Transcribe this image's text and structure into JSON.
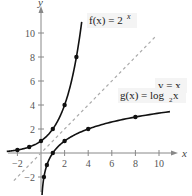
{
  "chart_data": {
    "type": "line",
    "title": "",
    "xlabel": "x",
    "ylabel": "y",
    "xlim": [
      -2.5,
      11.5
    ],
    "ylim": [
      -3.5,
      11.5
    ],
    "grid": false,
    "x_ticks": [
      -2,
      2,
      4,
      6,
      8,
      10
    ],
    "x_tick_labels": [
      "−2",
      "2",
      "4",
      "6",
      "8",
      "10"
    ],
    "y_ticks": [
      -2,
      2,
      4,
      6,
      8,
      10
    ],
    "y_tick_labels": [
      "−2",
      "2",
      "4",
      "6",
      "8",
      "10"
    ],
    "series": [
      {
        "name": "f(x) = 2^x",
        "label": "f(x) = 2",
        "label_sup": "x",
        "style": "solid",
        "color": "#111111",
        "points": [
          [
            -2,
            0.25
          ],
          [
            -1,
            0.5
          ],
          [
            0,
            1
          ],
          [
            1,
            2
          ],
          [
            2,
            4
          ],
          [
            3,
            8
          ]
        ]
      },
      {
        "name": "g(x) = log_2 x",
        "label": "g(x) = log",
        "label_sub": "2",
        "label_tail": " x",
        "style": "solid",
        "color": "#111111",
        "points": [
          [
            0.25,
            -2
          ],
          [
            0.5,
            -1
          ],
          [
            1,
            0
          ],
          [
            2,
            1
          ],
          [
            4,
            2
          ],
          [
            8,
            3
          ]
        ]
      },
      {
        "name": "y = x",
        "label": "y = x",
        "style": "dashed",
        "color": "#aaaaaa",
        "points": [
          [
            -2.5,
            -2.5
          ],
          [
            11,
            11
          ]
        ]
      }
    ]
  }
}
